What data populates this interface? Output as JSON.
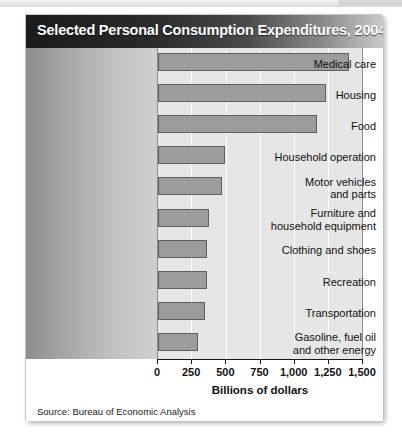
{
  "chart_data": {
    "type": "bar",
    "orientation": "horizontal",
    "title": "Selected Personal Consumption Expenditures, 2004",
    "xlabel": "Billions of dollars",
    "ylabel": "",
    "xlim": [
      0,
      1500
    ],
    "grid": true,
    "legend": null,
    "source": "Source: Bureau of Economic Analysis",
    "xticks": [
      0,
      250,
      500,
      750,
      1000,
      1250,
      1500
    ],
    "xtick_labels": [
      "0",
      "250",
      "500",
      "750",
      "1,000",
      "1,250",
      "1,500"
    ],
    "categories": [
      "Medical care",
      "Housing",
      "Food",
      "Household operation",
      "Motor vehicles\nand parts",
      "Furniture and\nhousehold equipment",
      "Clothing and shoes",
      "Recreation",
      "Transportation",
      "Gasoline, fuel oil\nand other energy"
    ],
    "values": [
      1400,
      1230,
      1165,
      490,
      470,
      375,
      355,
      360,
      345,
      290
    ],
    "bar_color": "#9c9c9c",
    "bar_edge_color": "#5f5f5f",
    "plot_background": "#e6e6e6",
    "label_panel_gradient": [
      "#8d8d8d",
      "#cfcfcf"
    ],
    "title_bar_gradient": [
      "#1b1b1b",
      "#c9c9c9"
    ],
    "title_text_color": "#ffffff"
  }
}
